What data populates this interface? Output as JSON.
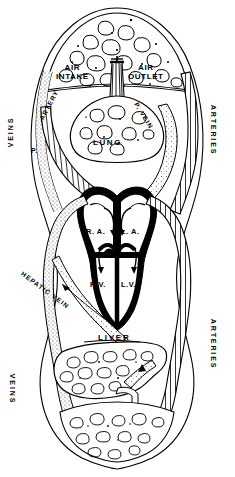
{
  "diagram": {
    "type": "anatomical-schematic",
    "colors": {
      "ink": "#000000",
      "background": "#ffffff",
      "stipple": "#555555"
    },
    "labels": {
      "air_intake": "AIR\nINTAKE",
      "air_intake_line1": "AIR",
      "air_intake_line2": "INTAKE",
      "air_outlet_line1": "AIR",
      "air_outlet_line2": "OUTLET",
      "lung": "LUNG",
      "liver": "LIVER",
      "right_atrium": "R. A.",
      "left_atrium": "L. A.",
      "right_ventricle": "R.V.",
      "left_ventricle": "L.V.",
      "veins_upper": "VEINS",
      "veins_lower": "VEINS",
      "arteries_upper": "ARTERIES",
      "arteries_lower": "ARTERIES",
      "pulmonary_prefix": "P.",
      "pulmonary_artery": "ARTERY",
      "pulmonary_vein": "P. VEIN",
      "hepatic_vein": "HEPATIC VEIN"
    },
    "regions": [
      {
        "name": "head-tissue",
        "label": ""
      },
      {
        "name": "lung",
        "label": "LUNG"
      },
      {
        "name": "trachea",
        "label": ""
      },
      {
        "name": "heart",
        "label": ""
      },
      {
        "name": "liver",
        "label": "LIVER"
      },
      {
        "name": "lower-body-tissue",
        "label": ""
      }
    ],
    "vessels": [
      {
        "name": "veins-upper",
        "label": "VEINS",
        "style": "stippled"
      },
      {
        "name": "arteries-upper",
        "label": "ARTERIES",
        "style": "hatched"
      },
      {
        "name": "pulmonary-artery",
        "label": "P. ARTERY",
        "style": "hatched"
      },
      {
        "name": "pulmonary-vein",
        "label": "P. VEIN",
        "style": "stippled"
      },
      {
        "name": "hepatic-vein",
        "label": "HEPATIC VEIN",
        "style": "stippled"
      },
      {
        "name": "veins-lower",
        "label": "VEINS",
        "style": "stippled"
      },
      {
        "name": "arteries-lower",
        "label": "ARTERIES",
        "style": "hatched"
      }
    ]
  }
}
